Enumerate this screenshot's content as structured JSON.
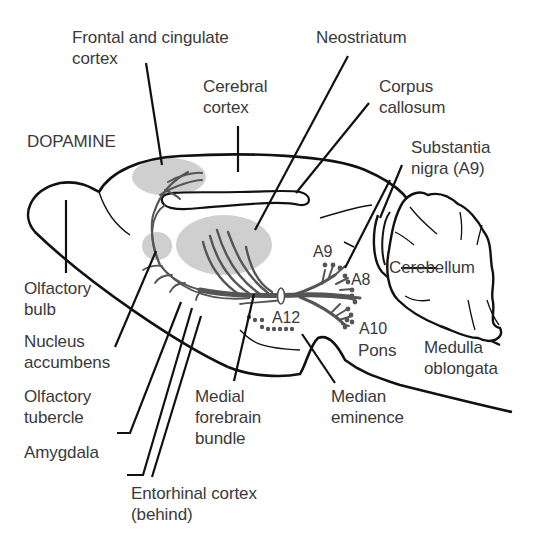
{
  "diagram": {
    "title": "DOPAMINE",
    "colors": {
      "outline": "#111111",
      "pathway": "#555555",
      "region_fill": "#cfcfcf",
      "text": "#3a3a3a",
      "background": "#ffffff"
    },
    "labels": {
      "frontal_cingulate": {
        "line1": "Frontal and cingulate",
        "line2": "cortex"
      },
      "neostriatum": {
        "line1": "Neostriatum"
      },
      "cerebral_cortex": {
        "line1": "Cerebral",
        "line2": "cortex"
      },
      "corpus_callosum": {
        "line1": "Corpus",
        "line2": "callosum"
      },
      "substantia_nigra": {
        "line1": "Substantia",
        "line2": "nigra (A9)"
      },
      "olfactory_bulb": {
        "line1": "Olfactory",
        "line2": "bulb"
      },
      "nucleus_accumbens": {
        "line1": "Nucleus",
        "line2": "accumbens"
      },
      "olfactory_tubercle": {
        "line1": "Olfactory",
        "line2": "tubercle"
      },
      "amygdala": {
        "line1": "Amygdala"
      },
      "entorhinal_cortex": {
        "line1": "Entorhinal cortex",
        "line2": "(behind)"
      },
      "medial_forebrain_bundle": {
        "line1": "Medial",
        "line2": "forebrain",
        "line3": "bundle"
      },
      "median_eminence": {
        "line1": "Median",
        "line2": "eminence"
      },
      "cerebellum": {
        "line1": "Cerebellum"
      },
      "pons": {
        "line1": "Pons"
      },
      "medulla_oblongata": {
        "line1": "Medulla",
        "line2": "oblongata"
      }
    },
    "cell_groups": {
      "a9": "A9",
      "a8": "A8",
      "a10": "A10",
      "a12": "A12"
    }
  }
}
